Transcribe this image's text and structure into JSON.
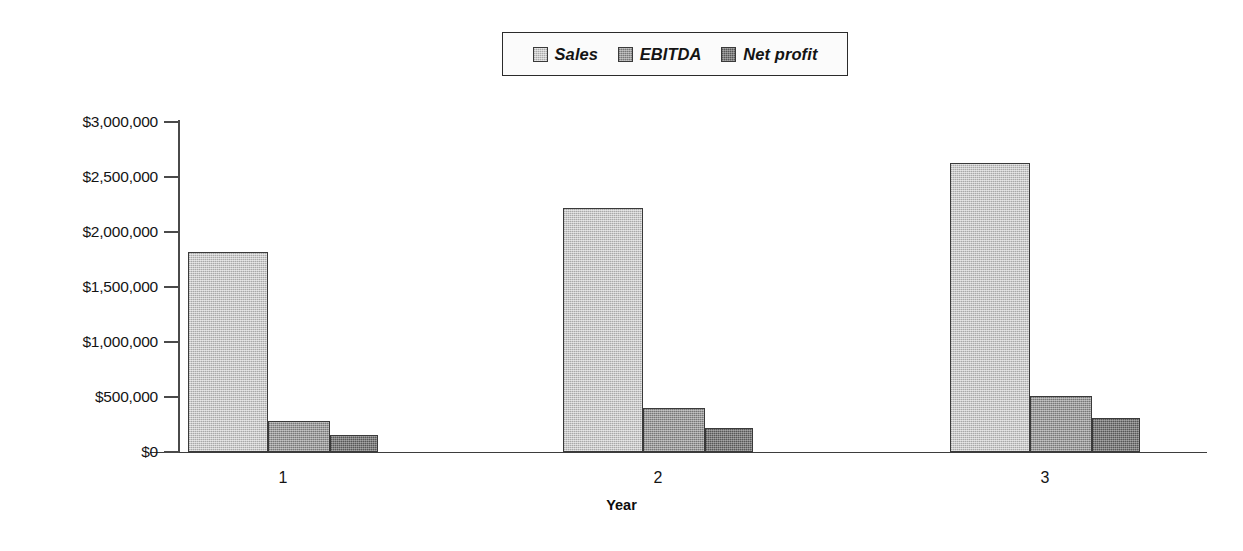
{
  "chart_data": {
    "type": "bar",
    "title": "",
    "subtitle": "",
    "xlabel": "Year",
    "ylabel": "",
    "categories": [
      "1",
      "2",
      "3"
    ],
    "series": [
      {
        "name": "Sales",
        "color": "#c9c9c9",
        "values": [
          1820000,
          2215000,
          2625000
        ]
      },
      {
        "name": "EBITDA",
        "color": "#9b9b9b",
        "values": [
          280000,
          400000,
          510000
        ]
      },
      {
        "name": "Net profit",
        "color": "#7e7e7e",
        "values": [
          155000,
          220000,
          310000
        ]
      }
    ],
    "ylim": [
      0,
      3000000
    ],
    "ytick_values": [
      0,
      500000,
      1000000,
      1500000,
      2000000,
      2500000,
      3000000
    ],
    "ytick_labels": [
      "$0",
      "$500,000",
      "$1,000,000",
      "$1,500,000",
      "$2,000,000",
      "$2,500,000",
      "$3,000,000"
    ],
    "grid": false,
    "legend_position": "top-center",
    "bar_style": "grouped-adjacent-halftone"
  },
  "legend": {
    "items": [
      {
        "label": "Sales",
        "swatch": "legend-swatch-sales"
      },
      {
        "label": "EBITDA",
        "swatch": "legend-swatch-ebitda"
      },
      {
        "label": "Net profit",
        "swatch": "legend-swatch-netprofit"
      }
    ]
  },
  "axes": {
    "x_title": "Year",
    "x_labels": [
      "1",
      "2",
      "3"
    ],
    "y_labels": [
      "$3,000,000",
      "$2,500,000",
      "$2,000,000",
      "$1,500,000",
      "$1,000,000",
      "$500,000",
      "$0"
    ]
  }
}
